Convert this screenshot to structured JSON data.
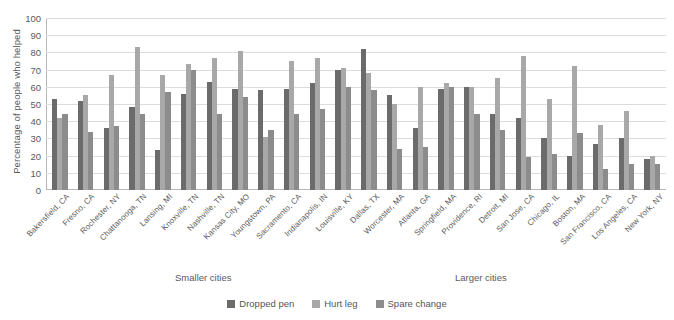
{
  "chart_data": {
    "type": "bar",
    "title": "",
    "xlabel": "",
    "ylabel": "Percentage of people who helped",
    "ylim": [
      0,
      100
    ],
    "ytick_values": [
      100,
      90,
      80,
      70,
      60,
      50,
      40,
      30,
      20,
      10,
      0
    ],
    "grid": true,
    "legend_position": "bottom",
    "categories": [
      "Bakersfield, CA",
      "Fresno, CA",
      "Rochester, NY",
      "Chattanooga, TN",
      "Lansing, MI",
      "Knoxville, TN",
      "Nashville, TN",
      "Kansas City, MO",
      "Youngstown, PA",
      "Sacramento, CA",
      "Indianapolis, IN",
      "Louisville, KY",
      "Dallas, TX",
      "Worcester, MA",
      "Atlanta, GA",
      "Springfield, MA",
      "Providence, RI",
      "Detroit, MI",
      "San Jose, CA",
      "Chicago, IL",
      "Boston, MA",
      "San Francisco, CA",
      "Los Angeles, CA",
      "New York, NY"
    ],
    "series": [
      {
        "name": "Dropped pen",
        "color": "#6b6b6b",
        "values": [
          53,
          52,
          36,
          48,
          23,
          56,
          63,
          59,
          58,
          59,
          62,
          70,
          82,
          55,
          36,
          59,
          60,
          44,
          42,
          30,
          20,
          27,
          30,
          18
        ]
      },
      {
        "name": "Hurt leg",
        "color": "#a8a8a8",
        "values": [
          42,
          55,
          67,
          83,
          67,
          73,
          77,
          81,
          31,
          75,
          77,
          71,
          68,
          50,
          60,
          62,
          60,
          65,
          78,
          53,
          72,
          38,
          46,
          20
        ]
      },
      {
        "name": "Spare change",
        "color": "#8c8c8c",
        "values": [
          44,
          34,
          37,
          44,
          57,
          70,
          44,
          54,
          35,
          44,
          47,
          60,
          58,
          24,
          25,
          60,
          44,
          35,
          19,
          21,
          33,
          12,
          15,
          15
        ]
      }
    ],
    "section_labels": {
      "smaller": "Smaller cities",
      "larger": "Larger cities"
    }
  }
}
